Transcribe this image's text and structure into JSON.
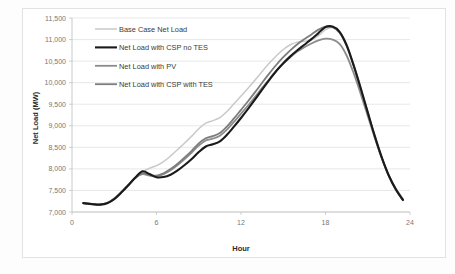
{
  "chart_data": {
    "type": "line",
    "title": "",
    "xlabel": "Hour",
    "ylabel": "Net Load (MW)",
    "xlim": [
      0,
      24
    ],
    "ylim": [
      7000,
      11500
    ],
    "xticks": [
      "0",
      "6",
      "12",
      "18",
      "24"
    ],
    "xtick_values": [
      0,
      6,
      12,
      18,
      24
    ],
    "yticks": [
      "7,000",
      "7,500",
      "8,000",
      "8,500",
      "9,000",
      "9,500",
      "10,000",
      "10,500",
      "11,000",
      "11,500"
    ],
    "ytick_values": [
      7000,
      7500,
      8000,
      8500,
      9000,
      9500,
      10000,
      10500,
      11000,
      11500
    ],
    "grid": true,
    "legend_position": "top-left-inside",
    "x": [
      0.8,
      1.5,
      2,
      2.5,
      3,
      3.5,
      4,
      4.5,
      5,
      5.5,
      6,
      6.5,
      7,
      7.5,
      8,
      8.5,
      9,
      9.5,
      10,
      10.5,
      11,
      11.5,
      12,
      12.5,
      13,
      13.5,
      14,
      14.5,
      15,
      15.5,
      16,
      16.5,
      17,
      17.5,
      18,
      18.5,
      19,
      19.5,
      20,
      20.5,
      21,
      21.5,
      22,
      22.5,
      23,
      23.5
    ],
    "series": [
      {
        "name": "Base Case Net Load",
        "color": "#c9c9c9",
        "width": 1.5,
        "values": [
          7205,
          7180,
          7175,
          7215,
          7320,
          7470,
          7640,
          7800,
          7930,
          8015,
          8075,
          8170,
          8300,
          8450,
          8600,
          8760,
          8930,
          9060,
          9120,
          9190,
          9330,
          9510,
          9690,
          9870,
          10060,
          10260,
          10450,
          10620,
          10770,
          10880,
          10940,
          10960,
          10990,
          11090,
          11230,
          11280,
          11190,
          10890,
          10430,
          9900,
          9340,
          8790,
          8280,
          7850,
          7530,
          7290
        ]
      },
      {
        "name": "Net Load with CSP no TES",
        "color": "#1a1a1a",
        "width": 2.1,
        "values": [
          7205,
          7180,
          7172,
          7205,
          7300,
          7450,
          7620,
          7800,
          7945,
          7880,
          7805,
          7810,
          7865,
          7965,
          8090,
          8230,
          8390,
          8520,
          8570,
          8640,
          8790,
          8980,
          9180,
          9390,
          9610,
          9840,
          10060,
          10270,
          10450,
          10610,
          10750,
          10880,
          11010,
          11150,
          11290,
          11300,
          11180,
          10870,
          10400,
          9870,
          9310,
          8760,
          8260,
          7840,
          7520,
          7280
        ]
      },
      {
        "name": "Net Load with PV",
        "color": "#8c8c8c",
        "width": 1.8,
        "values": [
          7205,
          7180,
          7174,
          7210,
          7310,
          7460,
          7630,
          7790,
          7880,
          7845,
          7830,
          7880,
          7970,
          8090,
          8230,
          8380,
          8540,
          8660,
          8700,
          8770,
          8910,
          9090,
          9280,
          9470,
          9670,
          9880,
          10080,
          10270,
          10440,
          10590,
          10720,
          10820,
          10910,
          10980,
          11020,
          11000,
          10900,
          10630,
          10220,
          9740,
          9230,
          8720,
          8250,
          7850,
          7540,
          7300
        ]
      },
      {
        "name": "Net Load with CSP with TES",
        "color": "#7d7d7d",
        "width": 1.8,
        "values": [
          7205,
          7180,
          7173,
          7208,
          7305,
          7455,
          7625,
          7795,
          7900,
          7865,
          7845,
          7900,
          7995,
          8120,
          8265,
          8420,
          8590,
          8710,
          8760,
          8830,
          8980,
          9170,
          9370,
          9570,
          9780,
          10000,
          10210,
          10410,
          10590,
          10750,
          10890,
          11010,
          11120,
          11230,
          11300,
          11290,
          11160,
          10850,
          10390,
          9860,
          9300,
          8750,
          8250,
          7830,
          7510,
          7270
        ]
      }
    ]
  },
  "legend": {
    "items": [
      {
        "label": "Base Case Net Load"
      },
      {
        "label": "Net Load with CSP no TES"
      },
      {
        "label": "Net Load with PV"
      },
      {
        "label": "Net Load with CSP with TES"
      }
    ]
  },
  "axes": {
    "y_title": "Net Load (MW)",
    "x_title": "Hour"
  }
}
